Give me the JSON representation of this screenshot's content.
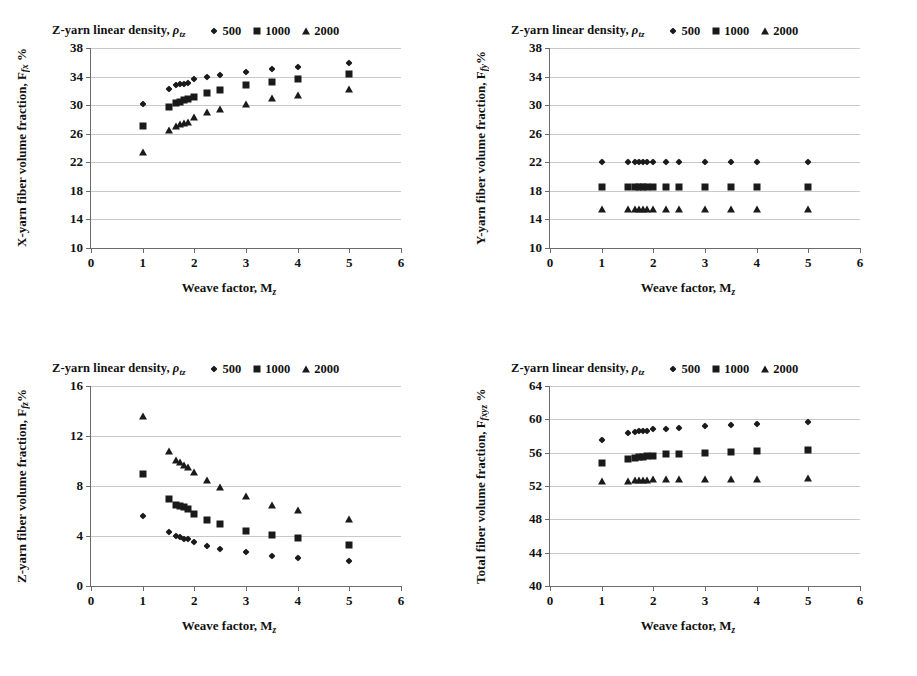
{
  "figure": {
    "panels": [
      "x-yarn",
      "y-yarn",
      "z-yarn",
      "total"
    ]
  },
  "legend": {
    "title_prefix": "Z-yarn linear density, ",
    "title_symbol": "ρ",
    "title_subscript": "tz",
    "entries": [
      {
        "marker": "diamond-marker",
        "label": "500"
      },
      {
        "marker": "square-marker",
        "label": "1000"
      },
      {
        "marker": "triangle-marker",
        "label": "2000"
      }
    ]
  },
  "axis": {
    "xlabel_prefix": "Weave factor, M",
    "xlabel_subscript": "z",
    "xticks": [
      "0",
      "1",
      "2",
      "3",
      "4",
      "5",
      "6"
    ]
  },
  "chart_data": [
    {
      "id": "x-yarn",
      "type": "scatter",
      "title": "",
      "ylabel_prefix": "X-yarn fiber volume fraction,  F",
      "ylabel_subscript": "fx",
      "ylabel_suffix": " %",
      "xlabel": "Weave factor, Mz",
      "xlim": [
        0,
        6
      ],
      "ylim": [
        10,
        38
      ],
      "xticks": [
        0,
        1,
        2,
        3,
        4,
        5,
        6
      ],
      "yticks": [
        10,
        14,
        18,
        22,
        26,
        30,
        34,
        38
      ],
      "grid": true,
      "legend_position": "top",
      "series": [
        {
          "name": "500",
          "marker": "diamond",
          "points": [
            [
              1.0,
              30.1
            ],
            [
              1.5,
              32.3
            ],
            [
              1.65,
              32.8
            ],
            [
              1.72,
              32.9
            ],
            [
              1.8,
              33.0
            ],
            [
              1.87,
              33.1
            ],
            [
              2.0,
              33.6
            ],
            [
              2.25,
              33.9
            ],
            [
              2.5,
              34.2
            ],
            [
              3.0,
              34.7
            ],
            [
              3.5,
              35.1
            ],
            [
              4.0,
              35.4
            ],
            [
              5.0,
              35.9
            ]
          ]
        },
        {
          "name": "1000",
          "marker": "square",
          "points": [
            [
              1.0,
              27.1
            ],
            [
              1.5,
              29.8
            ],
            [
              1.65,
              30.3
            ],
            [
              1.72,
              30.5
            ],
            [
              1.8,
              30.7
            ],
            [
              1.87,
              30.8
            ],
            [
              2.0,
              31.1
            ],
            [
              2.25,
              31.7
            ],
            [
              2.5,
              32.1
            ],
            [
              3.0,
              32.8
            ],
            [
              3.5,
              33.3
            ],
            [
              4.0,
              33.7
            ],
            [
              5.0,
              34.3
            ]
          ]
        },
        {
          "name": "2000",
          "marker": "triangle",
          "points": [
            [
              1.0,
              23.5
            ],
            [
              1.5,
              26.5
            ],
            [
              1.65,
              27.1
            ],
            [
              1.72,
              27.3
            ],
            [
              1.8,
              27.5
            ],
            [
              1.87,
              27.6
            ],
            [
              2.0,
              28.4
            ],
            [
              2.25,
              29.0
            ],
            [
              2.5,
              29.5
            ],
            [
              3.0,
              30.2
            ],
            [
              3.5,
              31.0
            ],
            [
              4.0,
              31.4
            ],
            [
              5.0,
              32.3
            ]
          ]
        }
      ]
    },
    {
      "id": "y-yarn",
      "type": "scatter",
      "title": "",
      "ylabel_prefix": "Y-yarn fiber volume fraction,  F",
      "ylabel_subscript": "fy",
      "ylabel_suffix": "%",
      "xlabel": "Weave factor, Mz",
      "xlim": [
        0,
        6
      ],
      "ylim": [
        10,
        38
      ],
      "xticks": [
        0,
        1,
        2,
        3,
        4,
        5,
        6
      ],
      "yticks": [
        10,
        14,
        18,
        22,
        26,
        30,
        34,
        38
      ],
      "grid": true,
      "legend_position": "top",
      "series": [
        {
          "name": "500",
          "marker": "diamond",
          "points": [
            [
              1.0,
              22.0
            ],
            [
              1.5,
              22.0
            ],
            [
              1.65,
              22.0
            ],
            [
              1.72,
              22.0
            ],
            [
              1.8,
              22.0
            ],
            [
              1.87,
              22.0
            ],
            [
              2.0,
              22.0
            ],
            [
              2.25,
              22.0
            ],
            [
              2.5,
              22.0
            ],
            [
              3.0,
              22.0
            ],
            [
              3.5,
              22.0
            ],
            [
              4.0,
              22.0
            ],
            [
              5.0,
              22.0
            ]
          ]
        },
        {
          "name": "1000",
          "marker": "square",
          "points": [
            [
              1.0,
              18.6
            ],
            [
              1.5,
              18.6
            ],
            [
              1.65,
              18.6
            ],
            [
              1.72,
              18.6
            ],
            [
              1.8,
              18.6
            ],
            [
              1.87,
              18.6
            ],
            [
              2.0,
              18.6
            ],
            [
              2.25,
              18.6
            ],
            [
              2.5,
              18.6
            ],
            [
              3.0,
              18.6
            ],
            [
              3.5,
              18.6
            ],
            [
              4.0,
              18.6
            ],
            [
              5.0,
              18.6
            ]
          ]
        },
        {
          "name": "2000",
          "marker": "triangle",
          "points": [
            [
              1.0,
              15.4
            ],
            [
              1.5,
              15.4
            ],
            [
              1.65,
              15.4
            ],
            [
              1.72,
              15.4
            ],
            [
              1.8,
              15.4
            ],
            [
              1.87,
              15.4
            ],
            [
              2.0,
              15.4
            ],
            [
              2.25,
              15.4
            ],
            [
              2.5,
              15.4
            ],
            [
              3.0,
              15.4
            ],
            [
              3.5,
              15.4
            ],
            [
              4.0,
              15.4
            ],
            [
              5.0,
              15.4
            ]
          ]
        }
      ]
    },
    {
      "id": "z-yarn",
      "type": "scatter",
      "title": "",
      "ylabel_prefix": "Z-yarn fiber volume fraction,  F",
      "ylabel_subscript": "fz",
      "ylabel_suffix": "%",
      "xlabel": "Weave factor, Mz",
      "xlim": [
        0,
        6
      ],
      "ylim": [
        0,
        16
      ],
      "xticks": [
        0,
        1,
        2,
        3,
        4,
        5,
        6
      ],
      "yticks": [
        0,
        4,
        8,
        12,
        16
      ],
      "grid": true,
      "legend_position": "top",
      "series": [
        {
          "name": "500",
          "marker": "diamond",
          "points": [
            [
              1.0,
              5.6
            ],
            [
              1.5,
              4.3
            ],
            [
              1.65,
              4.0
            ],
            [
              1.72,
              3.9
            ],
            [
              1.8,
              3.8
            ],
            [
              1.87,
              3.75
            ],
            [
              2.0,
              3.5
            ],
            [
              2.25,
              3.2
            ],
            [
              2.5,
              3.0
            ],
            [
              3.0,
              2.7
            ],
            [
              3.5,
              2.4
            ],
            [
              4.0,
              2.25
            ],
            [
              5.0,
              2.0
            ]
          ]
        },
        {
          "name": "1000",
          "marker": "square",
          "points": [
            [
              1.0,
              9.0
            ],
            [
              1.5,
              7.0
            ],
            [
              1.65,
              6.5
            ],
            [
              1.72,
              6.4
            ],
            [
              1.8,
              6.3
            ],
            [
              1.87,
              6.15
            ],
            [
              2.0,
              5.8
            ],
            [
              2.25,
              5.3
            ],
            [
              2.5,
              5.0
            ],
            [
              3.0,
              4.4
            ],
            [
              3.5,
              4.1
            ],
            [
              4.0,
              3.85
            ],
            [
              5.0,
              3.3
            ]
          ]
        },
        {
          "name": "2000",
          "marker": "triangle",
          "points": [
            [
              1.0,
              13.6
            ],
            [
              1.5,
              10.8
            ],
            [
              1.65,
              10.1
            ],
            [
              1.72,
              9.9
            ],
            [
              1.8,
              9.7
            ],
            [
              1.87,
              9.5
            ],
            [
              2.0,
              9.1
            ],
            [
              2.25,
              8.5
            ],
            [
              2.5,
              7.9
            ],
            [
              3.0,
              7.2
            ],
            [
              3.5,
              6.5
            ],
            [
              4.0,
              6.1
            ],
            [
              5.0,
              5.4
            ]
          ]
        }
      ]
    },
    {
      "id": "total",
      "type": "scatter",
      "title": "",
      "ylabel_prefix": "Total fiber volume fraction,  F",
      "ylabel_subscript": "fxyz",
      "ylabel_suffix": " %",
      "xlabel": "Weave factor, Mz",
      "xlim": [
        0,
        6
      ],
      "ylim": [
        40,
        64
      ],
      "xticks": [
        0,
        1,
        2,
        3,
        4,
        5,
        6
      ],
      "yticks": [
        40,
        44,
        48,
        52,
        56,
        60,
        64
      ],
      "grid": true,
      "legend_position": "top",
      "series": [
        {
          "name": "500",
          "marker": "diamond",
          "points": [
            [
              1.0,
              57.5
            ],
            [
              1.5,
              58.4
            ],
            [
              1.65,
              58.5
            ],
            [
              1.72,
              58.55
            ],
            [
              1.8,
              58.6
            ],
            [
              1.87,
              58.6
            ],
            [
              2.0,
              58.8
            ],
            [
              2.25,
              58.9
            ],
            [
              2.5,
              59.0
            ],
            [
              3.0,
              59.2
            ],
            [
              3.5,
              59.35
            ],
            [
              4.0,
              59.5
            ],
            [
              5.0,
              59.7
            ]
          ]
        },
        {
          "name": "1000",
          "marker": "square",
          "points": [
            [
              1.0,
              54.8
            ],
            [
              1.5,
              55.3
            ],
            [
              1.65,
              55.4
            ],
            [
              1.72,
              55.45
            ],
            [
              1.8,
              55.5
            ],
            [
              1.87,
              55.55
            ],
            [
              2.0,
              55.65
            ],
            [
              2.25,
              55.8
            ],
            [
              2.5,
              55.9
            ],
            [
              3.0,
              56.0
            ],
            [
              3.5,
              56.1
            ],
            [
              4.0,
              56.2
            ],
            [
              5.0,
              56.3
            ]
          ]
        },
        {
          "name": "2000",
          "marker": "triangle",
          "points": [
            [
              1.0,
              52.6
            ],
            [
              1.5,
              52.65
            ],
            [
              1.65,
              52.7
            ],
            [
              1.72,
              52.7
            ],
            [
              1.8,
              52.75
            ],
            [
              1.87,
              52.75
            ],
            [
              2.0,
              52.8
            ],
            [
              2.25,
              52.8
            ],
            [
              2.5,
              52.85
            ],
            [
              3.0,
              52.9
            ],
            [
              3.5,
              52.9
            ],
            [
              4.0,
              52.9
            ],
            [
              5.0,
              52.95
            ]
          ]
        }
      ]
    }
  ]
}
